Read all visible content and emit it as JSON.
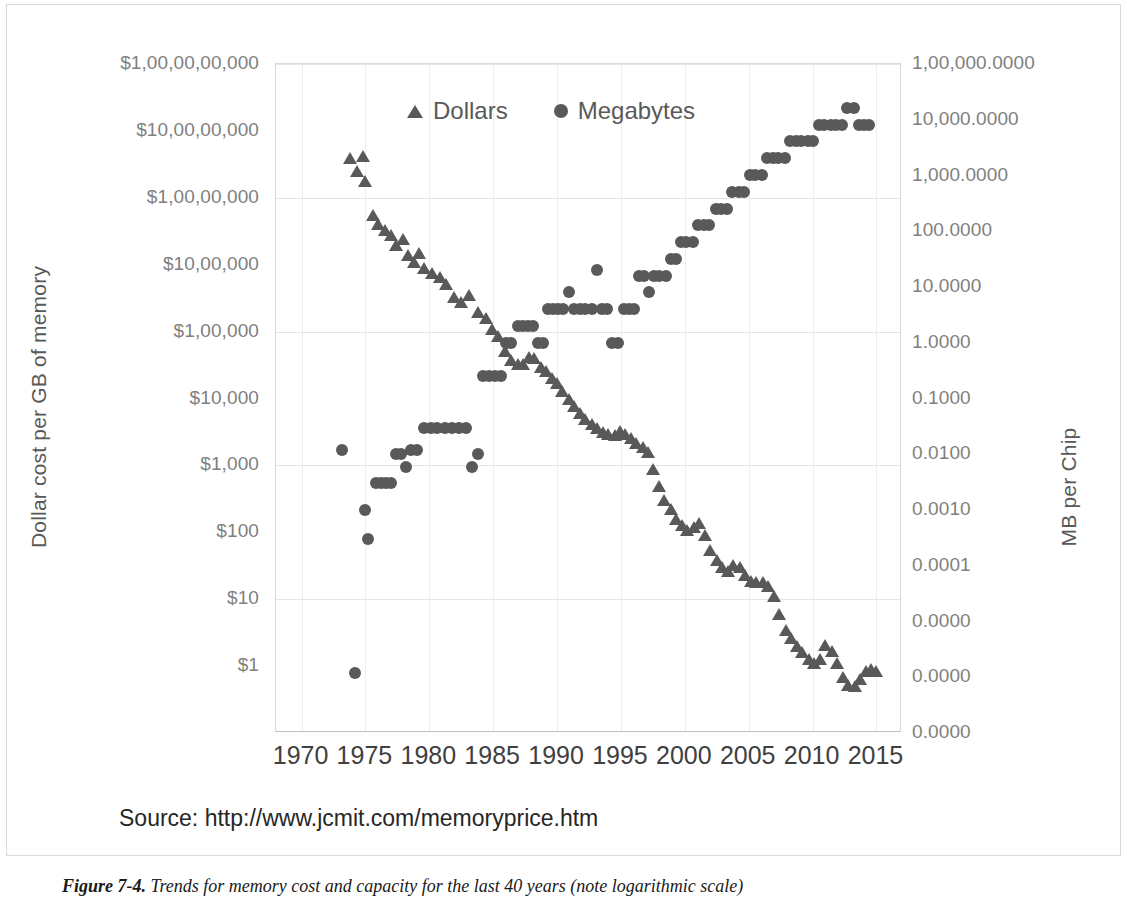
{
  "figure": {
    "caption_label": "Figure 7-4.",
    "caption_text": "Trends for memory cost and capacity for the last 40 years (note logarithmic scale)",
    "source_note": "Source:  http://www.jcmit.com/memoryprice.htm"
  },
  "colors": {
    "marker": "#595959",
    "tick_text": "#7f7f7f",
    "axis_title": "#595959",
    "gridline": "#e4e4e4",
    "plot_border": "#d9d9d9",
    "background": "#ffffff"
  },
  "chart_data": {
    "type": "scatter",
    "title": "",
    "subtitle": "",
    "xlabel": "",
    "ylabel": "Dollar cost  per GB of memory",
    "y2label": "MB per Chip",
    "grid": true,
    "legend_position": "top-center",
    "xlim": [
      1968,
      2017
    ],
    "xticks": [
      1970,
      1975,
      1980,
      1985,
      1990,
      1995,
      2000,
      2005,
      2010,
      2015
    ],
    "xticklabels": [
      "1970",
      "1975",
      "1980",
      "1985",
      "1990",
      "1995",
      "2000",
      "2005",
      "2010",
      "2015"
    ],
    "yscale": "log",
    "ylim": [
      1,
      10000000000
    ],
    "yticks": [
      1,
      10,
      100,
      1000,
      10000,
      100000,
      1000000,
      10000000,
      100000000,
      1000000000,
      10000000000
    ],
    "yticklabels": [
      "$1,00,00,00,000",
      "$10,00,00,000",
      "$1,00,00,000",
      "$10,00,000",
      "$1,00,000",
      "$10,000",
      "$1,000",
      "$100",
      "$10",
      "$1"
    ],
    "y2scale": "log",
    "y2lim": [
      1e-08,
      100000
    ],
    "y2ticklabels": [
      "1,00,000.0000",
      "10,000.0000",
      "1,000.0000",
      "100.0000",
      "10.0000",
      "1.0000",
      "0.1000",
      "0.0100",
      "0.0010",
      "0.0001",
      "0.0000",
      "0.0000",
      "0.0000"
    ],
    "series": [
      {
        "name": "Dollars",
        "marker": "triangle",
        "axis": "left",
        "unit": "dollars per GB",
        "points": [
          [
            1973.8,
            400000000
          ],
          [
            1974.3,
            250000000
          ],
          [
            1974.8,
            420000000
          ],
          [
            1975.0,
            180000000
          ],
          [
            1975.6,
            55000000
          ],
          [
            1976.0,
            40000000
          ],
          [
            1976.5,
            33000000
          ],
          [
            1977.0,
            28000000
          ],
          [
            1977.4,
            20000000
          ],
          [
            1977.9,
            24000000
          ],
          [
            1978.3,
            14000000
          ],
          [
            1978.8,
            11000000
          ],
          [
            1979.2,
            15000000
          ],
          [
            1979.6,
            9000000
          ],
          [
            1980.2,
            7500000
          ],
          [
            1980.8,
            6500000
          ],
          [
            1981.3,
            5200000
          ],
          [
            1981.9,
            3300000
          ],
          [
            1982.5,
            2800000
          ],
          [
            1983.1,
            3500000
          ],
          [
            1983.8,
            2000000
          ],
          [
            1984.4,
            1600000
          ],
          [
            1984.9,
            1100000
          ],
          [
            1985.4,
            850000
          ],
          [
            1985.9,
            520000
          ],
          [
            1986.4,
            380000
          ],
          [
            1986.9,
            330000
          ],
          [
            1987.3,
            330000
          ],
          [
            1987.8,
            420000
          ],
          [
            1988.2,
            400000
          ],
          [
            1988.7,
            300000
          ],
          [
            1989.1,
            260000
          ],
          [
            1989.6,
            200000
          ],
          [
            1990.0,
            170000
          ],
          [
            1990.4,
            130000
          ],
          [
            1990.9,
            100000
          ],
          [
            1991.3,
            77000
          ],
          [
            1991.8,
            60000
          ],
          [
            1992.2,
            50000
          ],
          [
            1992.7,
            42000
          ],
          [
            1993.1,
            36000
          ],
          [
            1993.6,
            32000
          ],
          [
            1994.0,
            30000
          ],
          [
            1994.5,
            29000
          ],
          [
            1994.9,
            33000
          ],
          [
            1995.3,
            30000
          ],
          [
            1995.8,
            26000
          ],
          [
            1996.2,
            22000
          ],
          [
            1996.7,
            19000
          ],
          [
            1997.1,
            16000
          ],
          [
            1997.5,
            9000
          ],
          [
            1998.0,
            5000
          ],
          [
            1998.4,
            3000
          ],
          [
            1998.9,
            2200
          ],
          [
            1999.3,
            1600
          ],
          [
            1999.8,
            1300
          ],
          [
            2000.2,
            1100
          ],
          [
            2000.7,
            1200
          ],
          [
            2001.1,
            1400
          ],
          [
            2001.6,
            900
          ],
          [
            2002.0,
            550
          ],
          [
            2002.5,
            380
          ],
          [
            2002.9,
            300
          ],
          [
            2003.4,
            260
          ],
          [
            2003.8,
            330
          ],
          [
            2004.3,
            300
          ],
          [
            2004.7,
            230
          ],
          [
            2005.2,
            190
          ],
          [
            2005.6,
            180
          ],
          [
            2006.1,
            180
          ],
          [
            2006.5,
            160
          ],
          [
            2007.0,
            110
          ],
          [
            2007.4,
            60
          ],
          [
            2007.9,
            35
          ],
          [
            2008.3,
            26
          ],
          [
            2008.8,
            20
          ],
          [
            2009.2,
            16
          ],
          [
            2009.7,
            13
          ],
          [
            2010.1,
            11
          ],
          [
            2010.6,
            13
          ],
          [
            2011.0,
            21
          ],
          [
            2011.5,
            17
          ],
          [
            2011.9,
            11
          ],
          [
            2012.4,
            7
          ],
          [
            2012.8,
            5.2
          ],
          [
            2013.3,
            5.0
          ],
          [
            2013.7,
            6.5
          ],
          [
            2014.2,
            8.5
          ],
          [
            2014.6,
            9.0
          ],
          [
            2015.0,
            8.5
          ]
        ]
      },
      {
        "name": "Megabytes",
        "marker": "circle",
        "axis": "right",
        "unit": "MB per chip",
        "points": [
          [
            1973.2,
            0.012
          ],
          [
            1974.2,
            1.2e-06
          ],
          [
            1975.0,
            0.001
          ],
          [
            1975.2,
            0.0003
          ],
          [
            1975.8,
            0.003
          ],
          [
            1976.2,
            0.003
          ],
          [
            1976.6,
            0.003
          ],
          [
            1977.0,
            0.003
          ],
          [
            1977.4,
            0.01
          ],
          [
            1977.8,
            0.01
          ],
          [
            1978.2,
            0.006
          ],
          [
            1978.6,
            0.012
          ],
          [
            1979.0,
            0.012
          ],
          [
            1979.6,
            0.03
          ],
          [
            1980.1,
            0.03
          ],
          [
            1980.6,
            0.03
          ],
          [
            1981.2,
            0.03
          ],
          [
            1981.8,
            0.03
          ],
          [
            1982.3,
            0.03
          ],
          [
            1982.9,
            0.03
          ],
          [
            1983.3,
            0.006
          ],
          [
            1983.8,
            0.01
          ],
          [
            1984.2,
            0.25
          ],
          [
            1984.7,
            0.25
          ],
          [
            1985.1,
            0.25
          ],
          [
            1985.6,
            0.25
          ],
          [
            1986.0,
            1.0
          ],
          [
            1986.4,
            1.0
          ],
          [
            1986.9,
            2.0
          ],
          [
            1987.3,
            2.0
          ],
          [
            1987.7,
            2.0
          ],
          [
            1988.1,
            2.0
          ],
          [
            1988.5,
            1.0
          ],
          [
            1988.9,
            1.0
          ],
          [
            1989.3,
            4.0
          ],
          [
            1989.7,
            4.0
          ],
          [
            1990.1,
            4.0
          ],
          [
            1990.5,
            4.0
          ],
          [
            1990.9,
            8.0
          ],
          [
            1991.3,
            4.0
          ],
          [
            1991.8,
            4.0
          ],
          [
            1992.2,
            4.0
          ],
          [
            1992.7,
            4.0
          ],
          [
            1993.1,
            20.0
          ],
          [
            1993.5,
            4.0
          ],
          [
            1993.9,
            4.0
          ],
          [
            1994.3,
            1.0
          ],
          [
            1994.8,
            1.0
          ],
          [
            1995.2,
            4.0
          ],
          [
            1995.6,
            4.0
          ],
          [
            1996.0,
            4.0
          ],
          [
            1996.4,
            16.0
          ],
          [
            1996.8,
            16.0
          ],
          [
            1997.2,
            8.0
          ],
          [
            1997.6,
            16.0
          ],
          [
            1998.0,
            16.0
          ],
          [
            1998.5,
            16.0
          ],
          [
            1998.9,
            32.0
          ],
          [
            1999.3,
            32.0
          ],
          [
            1999.7,
            64.0
          ],
          [
            2000.1,
            64.0
          ],
          [
            2000.6,
            64.0
          ],
          [
            2001.0,
            128.0
          ],
          [
            2001.5,
            128.0
          ],
          [
            2001.9,
            128.0
          ],
          [
            2002.4,
            256.0
          ],
          [
            2002.8,
            256.0
          ],
          [
            2003.3,
            256.0
          ],
          [
            2003.7,
            512.0
          ],
          [
            2004.2,
            512.0
          ],
          [
            2004.6,
            512.0
          ],
          [
            2005.1,
            1024.0
          ],
          [
            2005.5,
            1024.0
          ],
          [
            2006.0,
            1024.0
          ],
          [
            2006.4,
            2048.0
          ],
          [
            2006.9,
            2048.0
          ],
          [
            2007.3,
            2048.0
          ],
          [
            2007.8,
            2048.0
          ],
          [
            2008.2,
            4096.0
          ],
          [
            2008.7,
            4096.0
          ],
          [
            2009.1,
            4096.0
          ],
          [
            2009.6,
            4096.0
          ],
          [
            2010.0,
            4096.0
          ],
          [
            2010.5,
            8192.0
          ],
          [
            2010.9,
            8192.0
          ],
          [
            2011.4,
            8192.0
          ],
          [
            2011.8,
            8192.0
          ],
          [
            2012.3,
            8192.0
          ],
          [
            2012.7,
            16384.0
          ],
          [
            2013.2,
            16384.0
          ],
          [
            2013.6,
            8192.0
          ],
          [
            2014.0,
            8192.0
          ],
          [
            2014.4,
            8192.0
          ]
        ]
      }
    ],
    "legend": [
      {
        "label": "Dollars",
        "marker": "triangle"
      },
      {
        "label": "Megabytes",
        "marker": "circle"
      }
    ]
  }
}
